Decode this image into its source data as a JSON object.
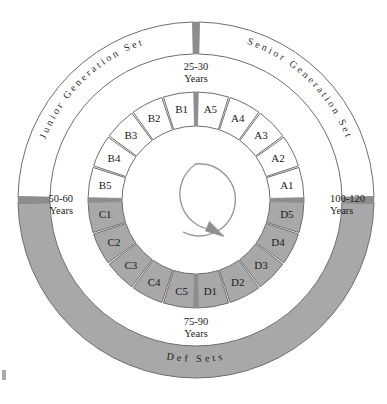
{
  "diagram": {
    "type": "concentric-ring-cycle",
    "center": {
      "x": 196,
      "y": 200
    },
    "rotation_icon": "circular-arrow-clockwise-icon",
    "colors": {
      "white_fill": "#ffffff",
      "gray_fill": "#a8a8a8",
      "stroke": "#6e6e6e",
      "divider": "#8d8d8d",
      "text": "#1a1a1a"
    },
    "outer_ring": {
      "name": "generation-sets-ring",
      "radius_outer": 178,
      "radius_inner": 146,
      "arcs": [
        {
          "id": "junior",
          "label": "Junior  Generation  Set",
          "fill": "white",
          "start_deg": 181,
          "end_deg": 269
        },
        {
          "id": "senior",
          "label": "Senior  Generation  Set",
          "fill": "white",
          "start_deg": 271,
          "end_deg": 359
        },
        {
          "id": "def",
          "label": "Def        Sets",
          "fill": "gray",
          "start_deg": 1,
          "end_deg": 179
        }
      ],
      "dividers_deg": [
        0,
        180,
        270
      ]
    },
    "inner_ring": {
      "name": "age-segment-ring",
      "radius_outer": 108,
      "radius_inner": 74,
      "groups": [
        {
          "id": "A",
          "fill": "white",
          "description": "Senior generation segments, top-right quadrant",
          "segments": [
            "A5",
            "A4",
            "A3",
            "A2",
            "A1"
          ]
        },
        {
          "id": "B",
          "fill": "white",
          "description": "Junior generation segments, top-left quadrant",
          "segments": [
            "B1",
            "B2",
            "B3",
            "B4",
            "B5"
          ]
        },
        {
          "id": "C",
          "fill": "gray",
          "description": "Def segments, bottom-left quadrant",
          "segments": [
            "C1",
            "C2",
            "C3",
            "C4",
            "C5"
          ]
        },
        {
          "id": "D",
          "fill": "gray",
          "description": "Def segments, bottom-right quadrant",
          "segments": [
            "D1",
            "D2",
            "D3",
            "D4",
            "D5"
          ]
        }
      ]
    },
    "year_labels": [
      {
        "id": "top",
        "line1": "25-30",
        "line2": "Years",
        "x": 196,
        "y": 70
      },
      {
        "id": "left",
        "line1": "50-60",
        "line2": "Years",
        "x": 73,
        "y": 202
      },
      {
        "id": "right",
        "line1": "100-120",
        "line2": "Years",
        "x": 330,
        "y": 202
      },
      {
        "id": "bottom",
        "line1": "75-90",
        "line2": "Years",
        "x": 196,
        "y": 325
      }
    ]
  }
}
